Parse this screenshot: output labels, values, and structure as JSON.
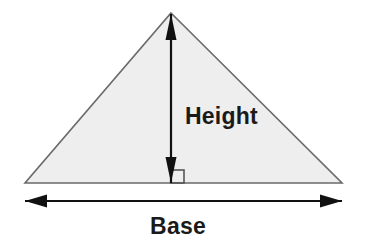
{
  "diagram": {
    "kind": "geometry-figure",
    "background_color": "#ffffff",
    "canvas": {
      "width": 367,
      "height": 246
    }
  },
  "shape": {
    "name": "triangle",
    "fill_color": "#eeeeee",
    "stroke_color": "#6a6a6a",
    "stroke_width": 1.6,
    "apex": {
      "x": 171,
      "y": 13
    },
    "left_vertex": {
      "x": 25,
      "y": 183
    },
    "right_vertex": {
      "x": 342,
      "y": 183
    }
  },
  "height_measure": {
    "label": "Height",
    "label_x": 185,
    "label_y": 124,
    "color": "#111111",
    "line_x": 171,
    "line_top_y": 14,
    "line_bottom_y": 183,
    "shaft_width": 2.2,
    "arrow_head_length": 26,
    "arrow_head_half_width": 5.5
  },
  "base_measure": {
    "label": "Base",
    "label_x": 178,
    "label_y": 234,
    "color": "#111111",
    "line_y": 201,
    "line_left_x": 25,
    "line_right_x": 342,
    "shaft_width": 2.0,
    "arrow_head_length": 22,
    "arrow_head_half_width": 6.5
  },
  "right_angle_marker": {
    "name": "right-angle-square",
    "color": "#555555",
    "stroke_width": 1.6,
    "x": 171,
    "y": 183,
    "size": 13
  }
}
